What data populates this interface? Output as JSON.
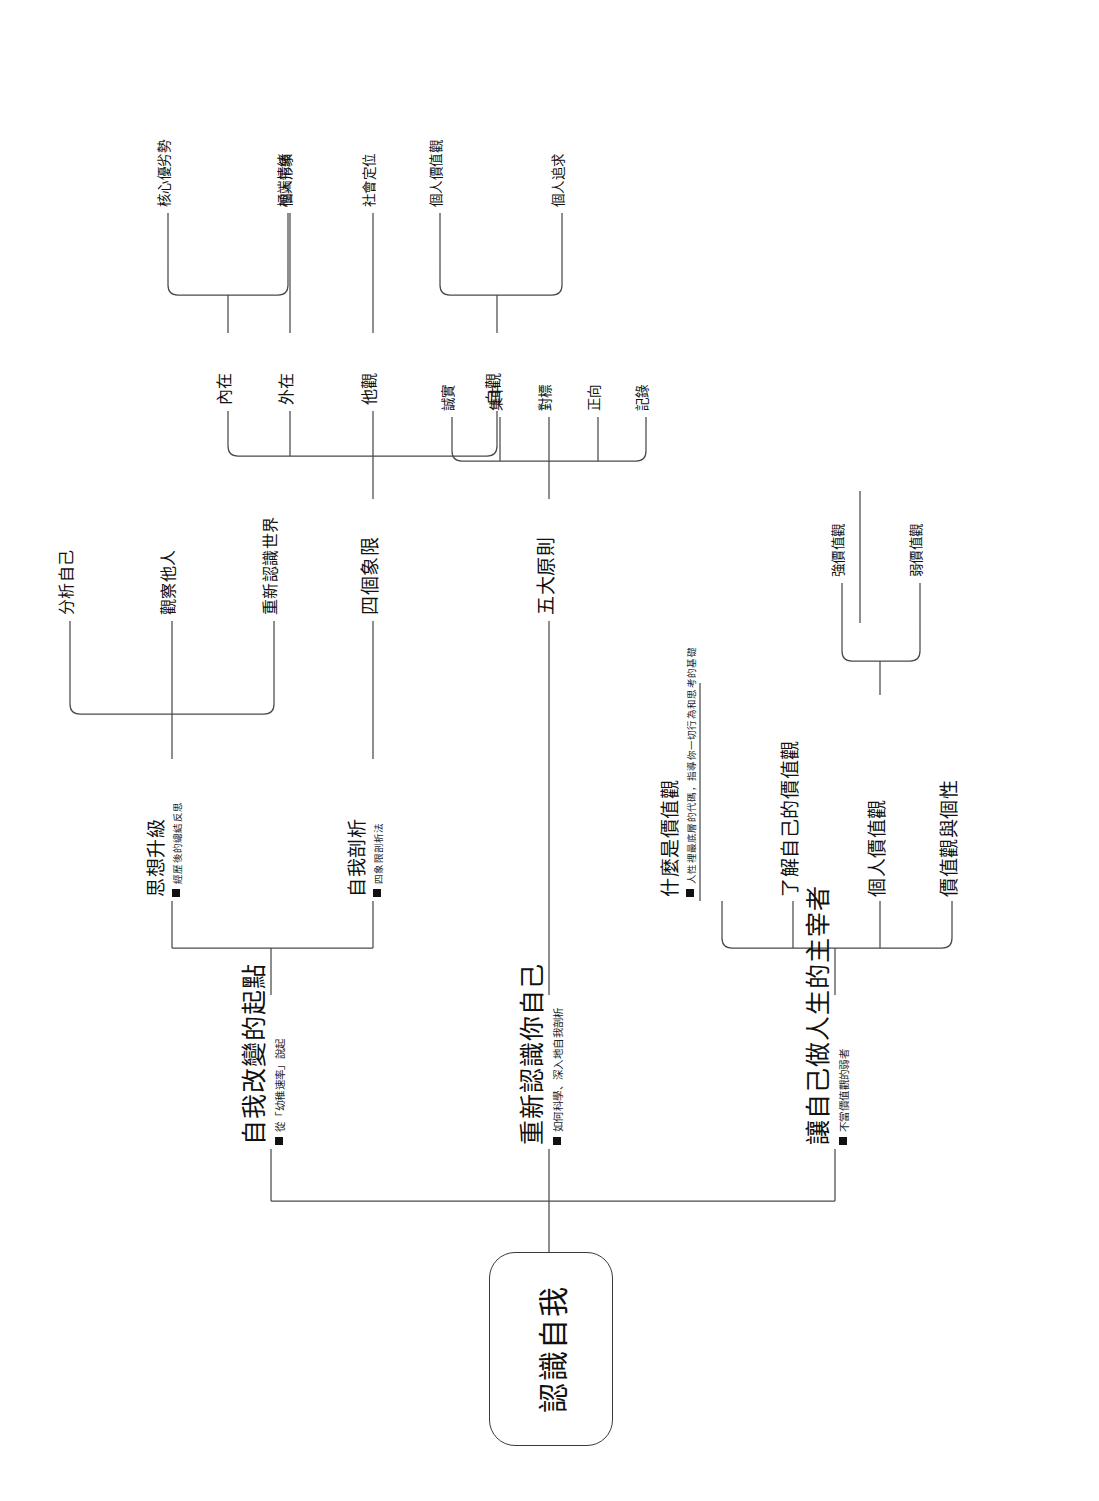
{
  "diagram": {
    "title": "認識自我",
    "root": {
      "label": "認識自我"
    },
    "branches": [
      {
        "id": "branch-1",
        "label": "自我改變的起點",
        "note": "從「幼稚速率」說起",
        "children": [
          {
            "id": "thought-upgrade",
            "label": "思想升級",
            "note": "經歷後的總結反思",
            "children": [
              {
                "label": "分析自己"
              },
              {
                "label": "觀察他人"
              },
              {
                "label": "重新認識世界"
              }
            ]
          },
          {
            "id": "self-analysis",
            "label": "自我剖析",
            "note": "四象限剖析法",
            "children": [
              {
                "label": "四個象限",
                "children": [
                  {
                    "label": "內在",
                    "children": [
                      {
                        "label": "核心優劣勢"
                      },
                      {
                        "label": "極端情緒"
                      }
                    ]
                  },
                  {
                    "label": "外在",
                    "children": [
                      {
                        "label": "個人形象"
                      }
                    ]
                  },
                  {
                    "label": "他觀",
                    "children": [
                      {
                        "label": "社會定位"
                      }
                    ]
                  },
                  {
                    "label": "自觀",
                    "children": [
                      {
                        "label": "個人價值觀"
                      },
                      {
                        "label": "個人追求"
                      }
                    ]
                  }
                ]
              }
            ]
          }
        ]
      },
      {
        "id": "branch-2",
        "label": "重新認識你自己",
        "note": "如何科學、深入地自我剖析",
        "children": [
          {
            "id": "five-principles",
            "label": "五大原則",
            "children": [
              {
                "label": "誠實"
              },
              {
                "label": "集中"
              },
              {
                "label": "對標"
              },
              {
                "label": "正向"
              },
              {
                "label": "記錄"
              }
            ]
          }
        ]
      },
      {
        "id": "branch-3",
        "label": "讓自己做人生的主宰者",
        "note": "不當價值觀的弱者",
        "children": [
          {
            "id": "what-is-values",
            "label": "什麼是價值觀",
            "note": "人性裡最底層的代碼，指導你一切行為和思考的基礎"
          },
          {
            "id": "know-your-values",
            "label": "了解自己的價值觀"
          },
          {
            "id": "personal-values",
            "label": "個人價值觀",
            "children": [
              {
                "label": "強價值觀"
              },
              {
                "label": "弱價值觀"
              }
            ]
          },
          {
            "id": "values-and-personality",
            "label": "價值觀與個性"
          }
        ]
      }
    ]
  },
  "style": {
    "line_color": "#4a4a4a",
    "text_color": "#111111",
    "background": "#ffffff"
  }
}
